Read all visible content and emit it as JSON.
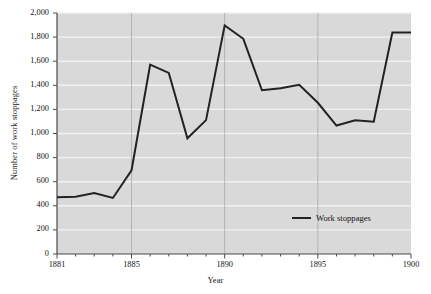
{
  "chart_data": {
    "type": "line",
    "title": "",
    "xlabel": "Year",
    "ylabel": "Number of work stoppages",
    "xlim": [
      1881,
      1900
    ],
    "ylim": [
      0,
      2000
    ],
    "grid": true,
    "legend_position": "inside-bottom-right",
    "x": [
      1881,
      1882,
      1883,
      1884,
      1885,
      1886,
      1887,
      1888,
      1889,
      1890,
      1891,
      1892,
      1893,
      1894,
      1895,
      1896,
      1897,
      1898,
      1899,
      1900
    ],
    "series": [
      {
        "name": "Work stoppages",
        "color": "#222222",
        "values": [
          470,
          476,
          506,
          465,
          695,
          1572,
          1503,
          960,
          1111,
          1897,
          1786,
          1359,
          1375,
          1404,
          1255,
          1066,
          1110,
          1098,
          1838,
          1839
        ]
      }
    ],
    "x_tick_labels": [
      "1881",
      "1885",
      "1890",
      "1895",
      "1900"
    ],
    "x_tick_values": [
      1881,
      1885,
      1890,
      1895,
      1900
    ],
    "y_tick_labels": [
      "0",
      "200",
      "400",
      "600",
      "800",
      "1,000",
      "1,200",
      "1,400",
      "1,600",
      "1,800",
      "2,000"
    ],
    "y_tick_values": [
      0,
      200,
      400,
      600,
      800,
      1000,
      1200,
      1400,
      1600,
      1800,
      2000
    ],
    "legend": [
      {
        "label": "Work stoppages",
        "swatch": "line",
        "color": "#222222"
      }
    ],
    "colors": {
      "plot_background": "#d9d9d9",
      "horizontal_gridline": "#f2f2f2",
      "vertical_gridline": "#a8a8a8",
      "axis": "#4a4a4a",
      "line": "#222222",
      "text": "#141414"
    }
  }
}
